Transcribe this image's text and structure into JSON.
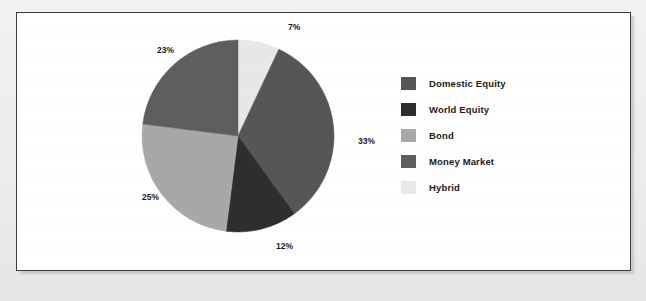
{
  "chart_data": {
    "type": "pie",
    "title": "",
    "subtitle": "",
    "xlabel": "",
    "ylabel": "",
    "legend_position": "right",
    "grid": false,
    "start_angle_deg": 0,
    "direction": "clockwise",
    "categories": [
      "Hybrid",
      "Domestic Equity",
      "World Equity",
      "Bond",
      "Money Market"
    ],
    "values": [
      7,
      33,
      12,
      25,
      23
    ],
    "value_suffix": "%",
    "slices": [
      {
        "label": "Hybrid",
        "value": 7,
        "display": "7%",
        "color": "#e8e8e8",
        "label_x": 271,
        "label_y": 17
      },
      {
        "label": "Domestic Equity",
        "value": 33,
        "display": "33%",
        "color": "#565656",
        "label_x": 341,
        "label_y": 131
      },
      {
        "label": "World Equity",
        "value": 12,
        "display": "12%",
        "color": "#2e2e2e",
        "label_x": 259,
        "label_y": 236
      },
      {
        "label": "Bond",
        "value": 25,
        "display": "25%",
        "color": "#a8a8a8",
        "label_x": 125,
        "label_y": 187
      },
      {
        "label": "Money Market",
        "value": 23,
        "display": "23%",
        "color": "#5e5e5e",
        "label_x": 140,
        "label_y": 40
      }
    ],
    "legend": [
      {
        "label": "Domestic Equity",
        "color": "#565656"
      },
      {
        "label": "World Equity",
        "color": "#2e2e2e"
      },
      {
        "label": "Bond",
        "color": "#a8a8a8"
      },
      {
        "label": "Money Market",
        "color": "#5e5e5e"
      },
      {
        "label": "Hybrid",
        "color": "#e8e8e8"
      }
    ]
  },
  "figure": {
    "border_color": "#3a3a3a",
    "background": "#ffffff",
    "page_background": "#ececeb"
  },
  "geometry": {
    "center_x": 221,
    "center_y": 123,
    "radius": 96
  }
}
